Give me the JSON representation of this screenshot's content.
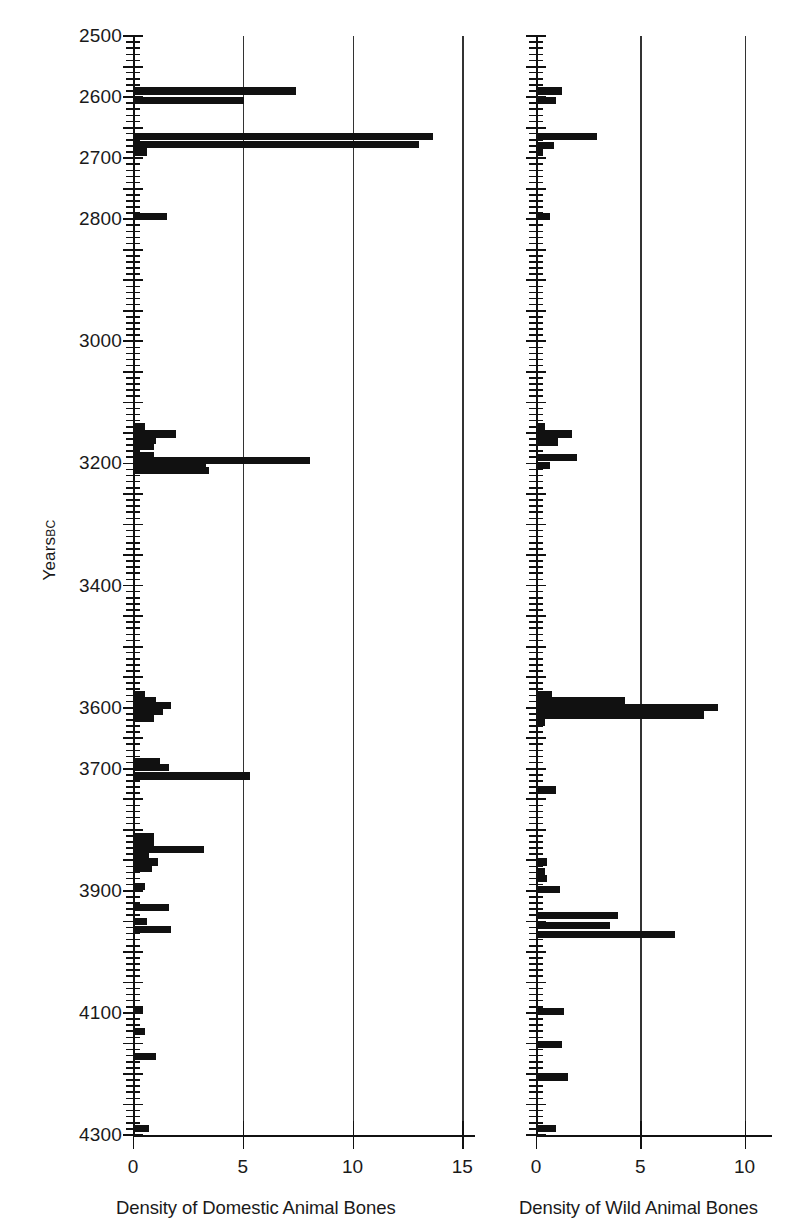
{
  "figure": {
    "y_axis_title": "Years",
    "y_axis_title_suffix": "BC"
  },
  "chart_data": {
    "type": "bar",
    "orientation": "horizontal",
    "title": "",
    "ylabel": "Years BC",
    "ylim": [
      4300,
      2500
    ],
    "y_tick_labels": [
      "2500",
      "2600",
      "2700",
      "2800",
      "2900",
      "3000",
      "3100",
      "3200",
      "3300",
      "3400",
      "3500",
      "3600",
      "3700",
      "3800",
      "3900",
      "4000",
      "4100",
      "4200",
      "4300"
    ],
    "y_tick_values": [
      2500,
      2600,
      2700,
      2800,
      2900,
      3000,
      3100,
      3200,
      3300,
      3400,
      3500,
      3600,
      3700,
      3800,
      3900,
      4000,
      4100,
      4200,
      4300
    ],
    "y_tick_labels_shown": [
      "2500",
      "2600",
      "2700",
      "2800",
      "",
      "3000",
      "",
      "3200",
      "",
      "3400",
      "",
      "3600",
      "3700",
      "",
      "3900",
      "",
      "4100",
      "",
      "4300"
    ],
    "y_minor_tick_interval": 10,
    "grid": "vertical gridlines at x = 5 and x = 10 (and 15 on left panel)",
    "panels": [
      {
        "name": "domestic",
        "xlabel": "Density of Domestic Animal Bones",
        "xlim": [
          0,
          15
        ],
        "x_tick_labels": [
          "0",
          "5",
          "10",
          "15"
        ],
        "x_tick_values": [
          0,
          5,
          10,
          15
        ],
        "gridlines": [
          5,
          10,
          15
        ],
        "points": [
          {
            "year": 2590,
            "value": 7.4
          },
          {
            "year": 2605,
            "value": 5.0
          },
          {
            "year": 2665,
            "value": 13.6
          },
          {
            "year": 2678,
            "value": 13.0
          },
          {
            "year": 2690,
            "value": 0.6
          },
          {
            "year": 2795,
            "value": 1.5
          },
          {
            "year": 3140,
            "value": 0.5
          },
          {
            "year": 3152,
            "value": 1.9
          },
          {
            "year": 3162,
            "value": 1.0
          },
          {
            "year": 3172,
            "value": 0.9
          },
          {
            "year": 3188,
            "value": 0.9
          },
          {
            "year": 3195,
            "value": 8.0
          },
          {
            "year": 3203,
            "value": 3.3
          },
          {
            "year": 3212,
            "value": 3.4
          },
          {
            "year": 3578,
            "value": 0.5
          },
          {
            "year": 3588,
            "value": 1.0
          },
          {
            "year": 3597,
            "value": 1.7
          },
          {
            "year": 3607,
            "value": 1.3
          },
          {
            "year": 3617,
            "value": 0.9
          },
          {
            "year": 3688,
            "value": 1.2
          },
          {
            "year": 3698,
            "value": 1.6
          },
          {
            "year": 3712,
            "value": 5.3
          },
          {
            "year": 3812,
            "value": 0.9
          },
          {
            "year": 3822,
            "value": 0.9
          },
          {
            "year": 3833,
            "value": 3.2
          },
          {
            "year": 3843,
            "value": 0.7
          },
          {
            "year": 3853,
            "value": 1.1
          },
          {
            "year": 3863,
            "value": 0.8
          },
          {
            "year": 3893,
            "value": 0.5
          },
          {
            "year": 3927,
            "value": 1.6
          },
          {
            "year": 3950,
            "value": 0.6
          },
          {
            "year": 3963,
            "value": 1.7
          },
          {
            "year": 4095,
            "value": 0.4
          },
          {
            "year": 4130,
            "value": 0.5
          },
          {
            "year": 4172,
            "value": 1.0
          },
          {
            "year": 4290,
            "value": 0.7
          }
        ]
      },
      {
        "name": "wild",
        "xlabel": "Density of Wild Animal Bones",
        "xlim": [
          0,
          11
        ],
        "x_tick_labels": [
          "0",
          "5",
          "10"
        ],
        "x_tick_values": [
          0,
          5,
          10
        ],
        "gridlines": [
          5,
          10
        ],
        "points": [
          {
            "year": 2590,
            "value": 1.2
          },
          {
            "year": 2605,
            "value": 0.9
          },
          {
            "year": 2665,
            "value": 2.9
          },
          {
            "year": 2680,
            "value": 0.8
          },
          {
            "year": 2690,
            "value": 0.3
          },
          {
            "year": 2795,
            "value": 0.6
          },
          {
            "year": 3140,
            "value": 0.4
          },
          {
            "year": 3152,
            "value": 1.7
          },
          {
            "year": 3165,
            "value": 1.0
          },
          {
            "year": 3190,
            "value": 1.9
          },
          {
            "year": 3203,
            "value": 0.6
          },
          {
            "year": 3578,
            "value": 0.7
          },
          {
            "year": 3588,
            "value": 4.2
          },
          {
            "year": 3600,
            "value": 8.7
          },
          {
            "year": 3612,
            "value": 8.0
          },
          {
            "year": 3625,
            "value": 0.4
          },
          {
            "year": 3735,
            "value": 0.9
          },
          {
            "year": 3853,
            "value": 0.5
          },
          {
            "year": 3868,
            "value": 0.4
          },
          {
            "year": 3880,
            "value": 0.5
          },
          {
            "year": 3898,
            "value": 1.1
          },
          {
            "year": 3940,
            "value": 3.9
          },
          {
            "year": 3957,
            "value": 3.5
          },
          {
            "year": 3972,
            "value": 6.6
          },
          {
            "year": 4098,
            "value": 1.3
          },
          {
            "year": 4152,
            "value": 1.2
          },
          {
            "year": 4205,
            "value": 1.5
          },
          {
            "year": 4290,
            "value": 0.9
          }
        ]
      }
    ]
  }
}
